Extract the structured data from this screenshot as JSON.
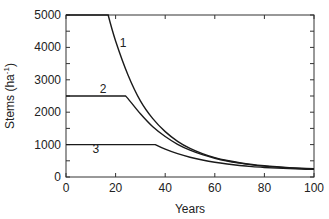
{
  "chart_data": {
    "type": "line",
    "title": "",
    "xlabel": "Years",
    "ylabel": "Stems (ha⁻¹)",
    "ylabel_main": "Stems (ha",
    "ylabel_sup": "-1",
    "ylabel_close": ")",
    "xlim": [
      0,
      100
    ],
    "ylim": [
      0,
      5000
    ],
    "xticks": [
      0,
      20,
      40,
      60,
      80,
      100
    ],
    "yticks": [
      0,
      1000,
      2000,
      3000,
      4000,
      5000
    ],
    "xtick_labels": [
      "0",
      "20",
      "40",
      "60",
      "80",
      "100"
    ],
    "ytick_labels": [
      "0",
      "1000",
      "2000",
      "3000",
      "4000",
      "5000"
    ],
    "grid": false,
    "legend": "inline numeric labels",
    "series": [
      {
        "name": "1",
        "label_pos": [
          23,
          4000
        ],
        "x": [
          0,
          17,
          20,
          25,
          30,
          35,
          40,
          45,
          50,
          55,
          60,
          65,
          70,
          75,
          80,
          85,
          90,
          95,
          100
        ],
        "values": [
          5000,
          5000,
          4200,
          3150,
          2350,
          1800,
          1400,
          1100,
          880,
          720,
          600,
          510,
          440,
          385,
          345,
          315,
          290,
          270,
          255
        ]
      },
      {
        "name": "2",
        "label_pos": [
          15,
          2600
        ],
        "x": [
          0,
          24,
          25,
          30,
          35,
          40,
          45,
          50,
          55,
          60,
          65,
          70,
          75,
          80,
          85,
          90,
          95,
          100
        ],
        "values": [
          2500,
          2500,
          2420,
          1950,
          1550,
          1250,
          1010,
          830,
          690,
          580,
          495,
          430,
          375,
          335,
          305,
          280,
          260,
          245
        ]
      },
      {
        "name": "3",
        "label_pos": [
          12,
          750
        ],
        "x": [
          0,
          36,
          40,
          45,
          50,
          55,
          60,
          65,
          70,
          75,
          80,
          85,
          90,
          95,
          100
        ],
        "values": [
          1000,
          1000,
          860,
          720,
          610,
          525,
          455,
          400,
          355,
          320,
          295,
          275,
          258,
          245,
          235
        ]
      }
    ]
  }
}
